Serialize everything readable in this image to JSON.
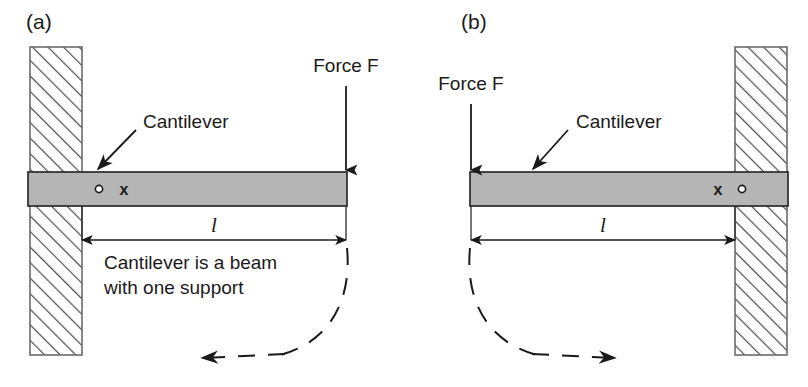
{
  "figure": {
    "type": "engineering-diagram",
    "background_color": "#ffffff",
    "line_color": "#1a1a1a",
    "beam_fill_color": "#b5b5b5",
    "wall_fill_color": "#ffffff",
    "wall_hatch_color": "#4d4d4d"
  },
  "panels": [
    {
      "id": "a",
      "label": "(a)",
      "support_side": "left",
      "force_side": "right",
      "force_label": "Force F",
      "force_direction": "down",
      "cantilever_label": "Cantilever",
      "dimension_label": "l",
      "beam_markers": [
        "o",
        "x"
      ],
      "caption_lines": [
        "Cantilever is a beam",
        "with one support"
      ],
      "rotation_arrow_direction": "left"
    },
    {
      "id": "b",
      "label": "(b)",
      "support_side": "right",
      "force_side": "left",
      "force_label": "Force F",
      "force_direction": "down",
      "cantilever_label": "Cantilever",
      "dimension_label": "l",
      "beam_markers": [
        "x",
        "o"
      ],
      "caption_lines": [],
      "rotation_arrow_direction": "right"
    }
  ]
}
